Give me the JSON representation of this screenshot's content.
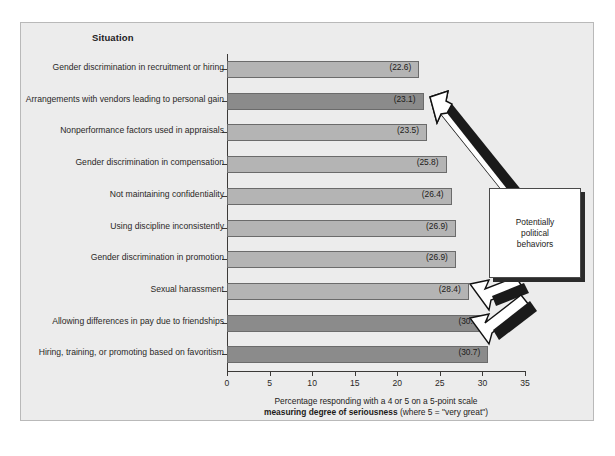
{
  "exhibit": {
    "column_header": "Situation"
  },
  "chart_data": {
    "type": "bar",
    "orientation": "horizontal",
    "title": "",
    "xlabel": "Percentage responding with a 4 or 5 on a 5-point scale measuring degree of seriousness (where 5 = \"very great\")",
    "ylabel": "Situation",
    "xlim": [
      0,
      35
    ],
    "xticks": [
      0,
      5,
      10,
      15,
      20,
      25,
      30,
      35
    ],
    "grid": false,
    "legend": "none",
    "categories": [
      "Gender discrimination in recruitment or hiring",
      "Arrangements with vendors leading to personal gain",
      "Nonperformance factors used in appraisals",
      "Gender discrimination in compensation",
      "Not maintaining confidentiality",
      "Using discipline inconsistently",
      "Gender discrimination in promotion",
      "Sexual harassment",
      "Allowing differences in pay due to friendships",
      "Hiring, training, or promoting based on favoritism"
    ],
    "values": [
      22.6,
      23.1,
      23.5,
      25.8,
      26.4,
      26.9,
      26.9,
      28.4,
      30.7,
      30.7
    ],
    "value_labels": [
      "(22.6)",
      "(23.1)",
      "(23.5)",
      "(25.8)",
      "(26.4)",
      "(26.9)",
      "(26.9)",
      "(28.4)",
      "(30.7)",
      "(30.7)"
    ],
    "highlighted": [
      false,
      true,
      false,
      false,
      false,
      false,
      false,
      false,
      true,
      true
    ],
    "colors": {
      "bar_light": "#b4b4b4",
      "bar_dark": "#8b8b8b",
      "bar_border": "#6b6b6b",
      "panel_background": "#ececec",
      "axis": "#3c3a38"
    }
  },
  "x_axis": {
    "caption_line1": "Percentage responding with a 4 or 5 on a 5-point scale",
    "caption_line2_bold": "measuring degree of seriousness",
    "caption_line2_rest": " (where 5 = \"very great\")"
  },
  "annotation": {
    "callout_line1": "Potentially",
    "callout_line2": "political",
    "callout_line3": "behaviors",
    "points_to": [
      "Arrangements with vendors leading to personal gain",
      "Allowing differences in pay due to friendships",
      "Hiring, training, or promoting based on favoritism"
    ]
  }
}
